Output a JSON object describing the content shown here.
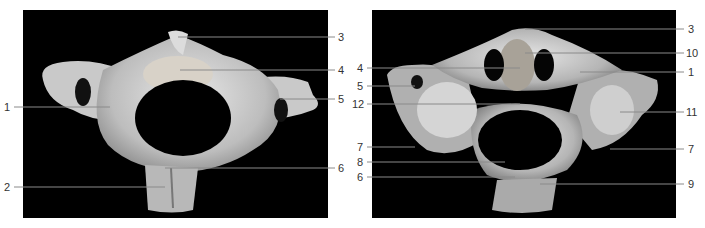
{
  "figure": {
    "left_panel": {
      "view": "superior view of cervical vertebra",
      "labels": [
        {
          "id": "l1",
          "text": "1",
          "side": "left",
          "y": 107
        },
        {
          "id": "l2",
          "text": "2",
          "side": "left",
          "y": 187
        },
        {
          "id": "l3",
          "text": "3",
          "side": "right",
          "y": 37
        },
        {
          "id": "l4",
          "text": "4",
          "side": "right",
          "y": 70
        },
        {
          "id": "l5",
          "text": "5",
          "side": "right",
          "y": 99
        },
        {
          "id": "l6",
          "text": "6",
          "side": "right",
          "y": 168
        }
      ]
    },
    "right_panel": {
      "view": "inferior/oblique view of cervical vertebra",
      "labels": [
        {
          "id": "r4",
          "text": "4",
          "side": "left",
          "y": 68
        },
        {
          "id": "r5",
          "text": "5",
          "side": "left",
          "y": 86
        },
        {
          "id": "r12",
          "text": "12",
          "side": "left",
          "y": 104
        },
        {
          "id": "r7a",
          "text": "7",
          "side": "left",
          "y": 147
        },
        {
          "id": "r8",
          "text": "8",
          "side": "left",
          "y": 162
        },
        {
          "id": "r6",
          "text": "6",
          "side": "left",
          "y": 177
        },
        {
          "id": "r3",
          "text": "3",
          "side": "right",
          "y": 29
        },
        {
          "id": "r10",
          "text": "10",
          "side": "right",
          "y": 53
        },
        {
          "id": "r1",
          "text": "1",
          "side": "right",
          "y": 72
        },
        {
          "id": "r11",
          "text": "11",
          "side": "right",
          "y": 112
        },
        {
          "id": "r7b",
          "text": "7",
          "side": "right",
          "y": 149
        },
        {
          "id": "r9",
          "text": "9",
          "side": "right",
          "y": 184
        }
      ]
    }
  }
}
